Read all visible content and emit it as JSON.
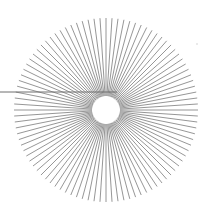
{
  "diagram": {
    "type": "radial-burst",
    "center": [
      106,
      110
    ],
    "inner_radius": 14,
    "outer_radius": 92,
    "ray_count": 96,
    "ray_color": "#8a8a8a",
    "background": "#ffffff",
    "pointer_line": {
      "x1": 0,
      "y1": 92,
      "x2": 117,
      "y2": 92,
      "color": "#6e6e6e"
    },
    "speck": {
      "x": 197,
      "y": 44,
      "r": 0.8
    }
  }
}
